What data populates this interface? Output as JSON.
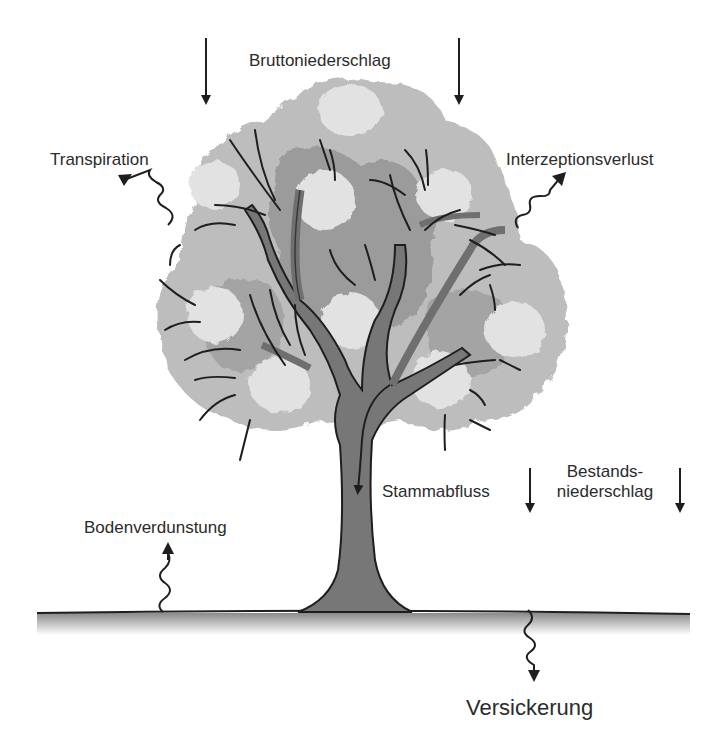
{
  "diagram": {
    "type": "water-balance-tree",
    "colors": {
      "background": "#ffffff",
      "canopy_light": "#e2e2e2",
      "canopy_mid": "#bdbdbd",
      "canopy_dark": "#9b9b9b",
      "trunk": "#777777",
      "outline": "#1e1e1e",
      "ground_shadow": "#9a9a9a",
      "text": "#2b2b2b"
    },
    "labels": {
      "gross_precipitation": "Bruttoniederschlag",
      "transpiration": "Transpiration",
      "interception_loss": "Interzeptionsverlust",
      "stemflow": "Stammabfluss",
      "throughfall_line1": "Bestands-",
      "throughfall_line2": "niederschlag",
      "soil_evaporation": "Bodenverdunstung",
      "percolation": "Versickerung"
    },
    "arrows": [
      {
        "name": "gross-precipitation-left",
        "style": "straight",
        "direction": "down"
      },
      {
        "name": "gross-precipitation-right",
        "style": "straight",
        "direction": "down"
      },
      {
        "name": "transpiration",
        "style": "wavy",
        "direction": "up-left"
      },
      {
        "name": "interception-loss",
        "style": "wavy",
        "direction": "up-right"
      },
      {
        "name": "stemflow",
        "style": "curved",
        "direction": "down"
      },
      {
        "name": "throughfall-left",
        "style": "straight",
        "direction": "down"
      },
      {
        "name": "throughfall-right",
        "style": "straight",
        "direction": "down"
      },
      {
        "name": "soil-evaporation",
        "style": "wavy",
        "direction": "up"
      },
      {
        "name": "percolation",
        "style": "wavy",
        "direction": "down"
      }
    ]
  }
}
